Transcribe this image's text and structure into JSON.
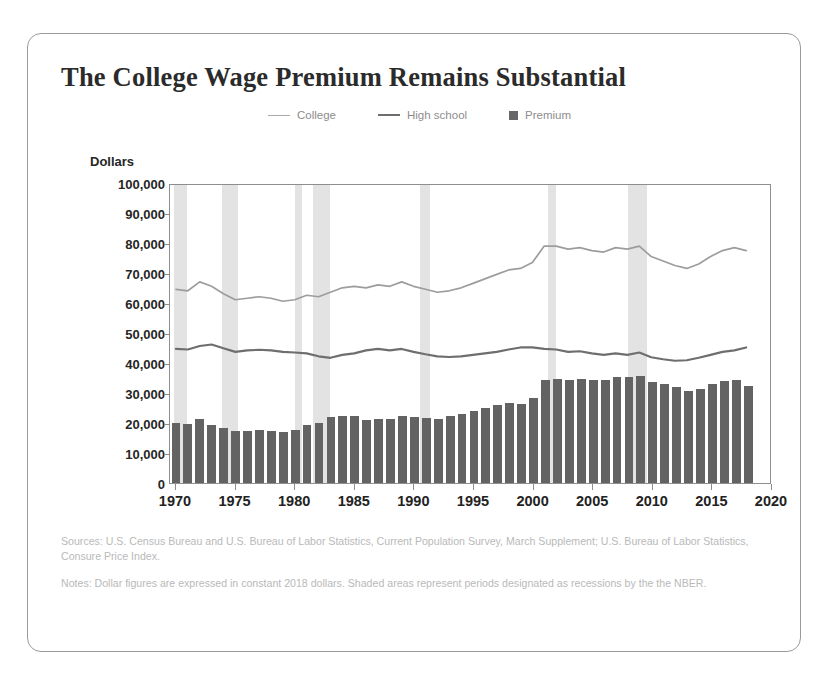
{
  "chart_data": {
    "type": "bar",
    "title": "The College Wage Premium Remains Substantial",
    "xlabel": "",
    "ylabel": "Dollars",
    "ylim": [
      0,
      100000
    ],
    "xlim": [
      1969.5,
      2020
    ],
    "grid": false,
    "legend_position": "top-center",
    "y_ticks": [
      "0",
      "10,000",
      "20,000",
      "30,000",
      "40,000",
      "50,000",
      "60,000",
      "70,000",
      "80,000",
      "90,000",
      "100,000"
    ],
    "y_tick_values": [
      0,
      10000,
      20000,
      30000,
      40000,
      50000,
      60000,
      70000,
      80000,
      90000,
      100000
    ],
    "x_ticks": [
      "1970",
      "1975",
      "1980",
      "1985",
      "1990",
      "1995",
      "2000",
      "2005",
      "2010",
      "2015",
      "2020"
    ],
    "x_tick_values": [
      1970,
      1975,
      1980,
      1985,
      1990,
      1995,
      2000,
      2005,
      2010,
      2015,
      2020
    ],
    "categories": [
      1970,
      1971,
      1972,
      1973,
      1974,
      1975,
      1976,
      1977,
      1978,
      1979,
      1980,
      1981,
      1982,
      1983,
      1984,
      1985,
      1986,
      1987,
      1988,
      1989,
      1990,
      1991,
      1992,
      1993,
      1994,
      1995,
      1996,
      1997,
      1998,
      1999,
      2000,
      2001,
      2002,
      2003,
      2004,
      2005,
      2006,
      2007,
      2008,
      2009,
      2010,
      2011,
      2012,
      2013,
      2014,
      2015,
      2016,
      2017,
      2018
    ],
    "series": [
      {
        "name": "College",
        "type": "line",
        "color": "#9d9d9d",
        "values": [
          65000,
          64500,
          67500,
          66000,
          63500,
          61500,
          62000,
          62500,
          62000,
          61000,
          61500,
          63000,
          62500,
          64000,
          65500,
          66000,
          65500,
          66500,
          66000,
          67500,
          66000,
          65000,
          64000,
          64500,
          65500,
          67000,
          68500,
          70000,
          71500,
          72000,
          74000,
          79500,
          79500,
          78500,
          79000,
          78000,
          77500,
          79000,
          78500,
          79500,
          76000,
          74500,
          73000,
          72000,
          73500,
          76000,
          78000,
          79000,
          78000
        ]
      },
      {
        "name": "High school",
        "type": "line",
        "color": "#6e6e6e",
        "values": [
          45000,
          44800,
          46000,
          46500,
          45200,
          44000,
          44500,
          44700,
          44500,
          44000,
          43800,
          43500,
          42500,
          42000,
          43000,
          43500,
          44500,
          45000,
          44500,
          45000,
          44000,
          43200,
          42500,
          42300,
          42500,
          43000,
          43500,
          44000,
          44800,
          45500,
          45500,
          45000,
          44800,
          44000,
          44200,
          43500,
          43000,
          43500,
          43000,
          43800,
          42200,
          41500,
          41000,
          41200,
          42000,
          43000,
          44000,
          44500,
          45500
        ]
      },
      {
        "name": "Premium",
        "type": "bar",
        "color": "#636363",
        "values": [
          20000,
          19800,
          21500,
          19500,
          18300,
          17500,
          17500,
          17800,
          17500,
          17000,
          17700,
          19500,
          20000,
          22000,
          22500,
          22500,
          21000,
          21500,
          21500,
          22500,
          22000,
          21800,
          21500,
          22200,
          23000,
          24000,
          25000,
          26000,
          26700,
          26500,
          28500,
          34500,
          34700,
          34500,
          34800,
          34500,
          34500,
          35500,
          35500,
          35700,
          33800,
          33000,
          32000,
          30800,
          31500,
          33000,
          34000,
          34500,
          32500
        ]
      }
    ],
    "recessions": [
      {
        "start": 1969.8,
        "end": 1970.9
      },
      {
        "start": 1973.9,
        "end": 1975.2
      },
      {
        "start": 1980.0,
        "end": 1980.6
      },
      {
        "start": 1981.5,
        "end": 1982.9
      },
      {
        "start": 1990.5,
        "end": 1991.3
      },
      {
        "start": 2001.2,
        "end": 2001.9
      },
      {
        "start": 2007.9,
        "end": 2009.5
      }
    ],
    "shading_color": "#e3e3e3"
  },
  "legend": {
    "items": [
      {
        "label": "College",
        "marker": "line"
      },
      {
        "label": "High school",
        "marker": "line-bold"
      },
      {
        "label": "Premium",
        "marker": "square"
      }
    ]
  },
  "footnotes": {
    "sources": "Sources: U.S. Census Bureau and U.S. Bureau of Labor Statistics, Current Population Survey, March Supplement; U.S. Bureau of Labor Statistics, Consure Price Index.",
    "notes": "Notes: Dollar figures are expressed in constant 2018 dollars. Shaded areas represent periods designated as recessions by the the NBER."
  }
}
